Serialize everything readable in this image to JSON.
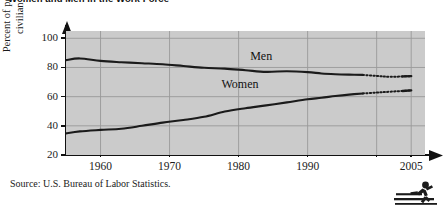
{
  "figure": {
    "title": "Women and Men in the Work Force",
    "source_note": "Source: U.S. Bureau of Labor Statistics.",
    "icon": "runner-hurdler-icon"
  },
  "chart_data": {
    "type": "line",
    "title": "Women and Men in the Work Force",
    "xlabel": "",
    "ylabel": "Percent of population in the civilian labor force",
    "ylabel_lines": [
      "Percent of population in the",
      "civilian labor force"
    ],
    "xlim": [
      1955,
      2007
    ],
    "ylim": [
      20,
      105
    ],
    "yticks": [
      20,
      40,
      60,
      80,
      100
    ],
    "ytick_labels": [
      "20",
      "40",
      "60",
      "80",
      "100"
    ],
    "xticks": [
      1960,
      1970,
      1980,
      1990,
      2000,
      2005
    ],
    "xtick_labels": [
      "1960",
      "1970",
      "1980",
      "1990",
      "",
      "2005"
    ],
    "grid": true,
    "grid_color": "#9a9a9a",
    "plot_background": "#cbcbcb",
    "line_color": "#1b1b1b",
    "legend": "inline-labels",
    "annotations": [
      {
        "text": "Men",
        "x": 1984,
        "y": 88
      },
      {
        "text": "Women",
        "x": 1981,
        "y": 69
      }
    ],
    "series": [
      {
        "name": "Men",
        "label": "Men",
        "style": "solid-then-projected",
        "projection_starts": 1998,
        "x": [
          1955,
          1957,
          1960,
          1963,
          1966,
          1969,
          1972,
          1975,
          1978,
          1981,
          1984,
          1987,
          1990,
          1992,
          1994,
          1996,
          1998,
          2000,
          2002,
          2005
        ],
        "values": [
          85.0,
          86.2,
          84.5,
          83.6,
          82.9,
          82.2,
          81.0,
          79.8,
          79.2,
          78.1,
          77.0,
          77.4,
          76.8,
          75.9,
          75.4,
          75.1,
          74.9,
          74.2,
          73.6,
          74.1
        ]
      },
      {
        "name": "Women",
        "label": "Women",
        "style": "solid-then-projected",
        "projection_starts": 1998,
        "x": [
          1955,
          1957,
          1960,
          1963,
          1966,
          1969,
          1972,
          1975,
          1978,
          1981,
          1984,
          1987,
          1990,
          1992,
          1994,
          1996,
          1998,
          2000,
          2002,
          2005
        ],
        "values": [
          34.8,
          36.2,
          37.2,
          38.0,
          40.0,
          42.2,
          44.0,
          46.2,
          49.8,
          52.1,
          54.0,
          56.1,
          58.2,
          59.2,
          60.4,
          61.4,
          62.2,
          62.8,
          63.4,
          64.3
        ]
      }
    ]
  }
}
